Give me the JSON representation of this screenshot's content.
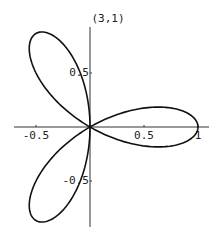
{
  "chart_data": {
    "type": "line",
    "subtype": "polar-rose",
    "title": "(3,1)",
    "equation": "r = cos(3θ)",
    "parameters": {
      "n": 3,
      "d": 1
    },
    "xlabel": "",
    "ylabel": "",
    "xlim": [
      -0.7,
      1.1
    ],
    "ylim": [
      -0.92,
      0.92
    ],
    "x_ticks": [
      -0.5,
      0.5,
      1
    ],
    "x_tick_labels": [
      "-0.5",
      "0.5",
      "1"
    ],
    "y_ticks": [
      0.5,
      -0.5
    ],
    "y_tick_labels": [
      "0.5",
      "-0.5"
    ],
    "grid": false,
    "legend": null,
    "petal_tips": [
      {
        "x": 1.0,
        "y": 0.0
      },
      {
        "x": -0.5,
        "y": 0.866
      },
      {
        "x": -0.5,
        "y": -0.866
      }
    ],
    "series": [
      {
        "name": "rose",
        "color": "#111111",
        "samples": 360
      }
    ]
  },
  "layout": {
    "origin_px": [
      90,
      127
    ],
    "scale_px_per_unit": 108,
    "x_axis_px": [
      14,
      209
    ],
    "y_axis_px": [
      27,
      227
    ],
    "title_px": [
      108,
      22
    ]
  }
}
